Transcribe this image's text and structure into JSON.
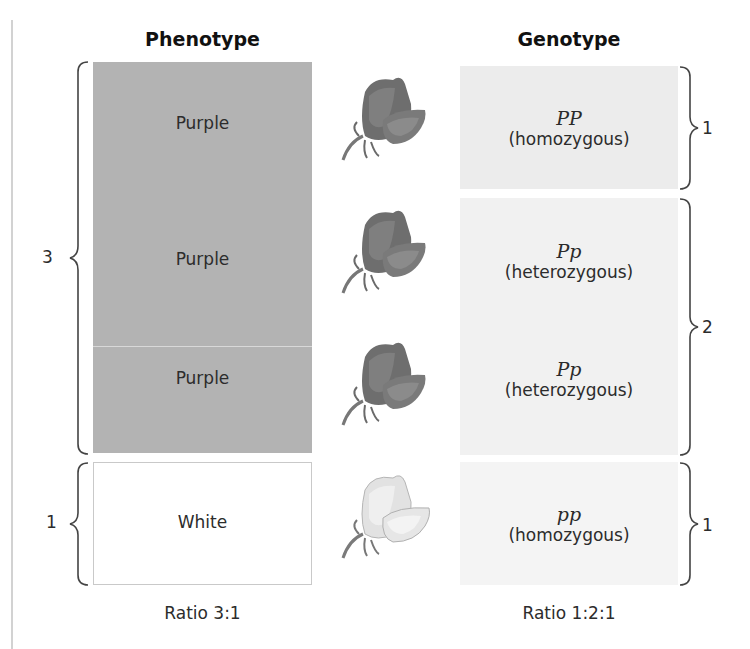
{
  "headers": {
    "phenotype": "Phenotype",
    "genotype": "Genotype"
  },
  "phenotype": {
    "rows": [
      {
        "label": "Purple",
        "color": "#b3b3b3"
      },
      {
        "label": "Purple",
        "color": "#b3b3b3"
      },
      {
        "label": "Purple",
        "color": "#b3b3b3"
      },
      {
        "label": "White",
        "color": "#ffffff"
      }
    ],
    "groups": [
      {
        "count": "3"
      },
      {
        "count": "1"
      }
    ],
    "ratio": "Ratio 3:1"
  },
  "flowers": [
    {
      "type": "purple-flower-icon"
    },
    {
      "type": "purple-flower-icon"
    },
    {
      "type": "purple-flower-icon"
    },
    {
      "type": "white-flower-icon"
    }
  ],
  "genotype": {
    "rows": [
      {
        "symbol": "PP",
        "description": "(homozygous)"
      },
      {
        "symbol": "Pp",
        "description": "(heterozygous)"
      },
      {
        "symbol": "Pp",
        "description": "(heterozygous)"
      },
      {
        "symbol": "pp",
        "description": "(homozygous)"
      }
    ],
    "groups": [
      {
        "count": "1"
      },
      {
        "count": "2"
      },
      {
        "count": "1"
      }
    ],
    "ratio": "Ratio 1:2:1"
  },
  "colors": {
    "purple_box": "#b3b3b3",
    "genotype_box": "#ececec",
    "bracket": "#444444"
  }
}
